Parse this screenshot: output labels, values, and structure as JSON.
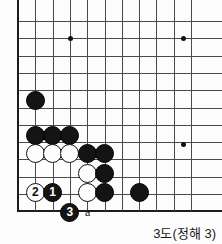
{
  "diagram": {
    "caption": "3도(정해 3)",
    "board": {
      "origin_x": 18,
      "origin_y": 21,
      "spacing": 17.3,
      "cols": 11,
      "rows": 12,
      "left_edge": true,
      "bottom_edge": true,
      "line_color": "#4a4a4a",
      "edge_color": "#1c1c1c"
    },
    "star_points": [
      {
        "name": "star-point-top-left",
        "col": 3,
        "row": 1
      },
      {
        "name": "star-point-top-right",
        "col": 9.55,
        "row": 1
      },
      {
        "name": "star-point-right",
        "col": 9.55,
        "row": 7.1
      }
    ],
    "stones": [
      {
        "name": "black-stone-left-upper",
        "color": "black",
        "col": 1,
        "row": 4.6,
        "label": ""
      },
      {
        "name": "black-stone-wall-a",
        "color": "black",
        "col": 1,
        "row": 6.6,
        "label": ""
      },
      {
        "name": "black-stone-wall-b",
        "color": "black",
        "col": 2,
        "row": 6.6,
        "label": ""
      },
      {
        "name": "black-stone-wall-c",
        "color": "black",
        "col": 3,
        "row": 6.6,
        "label": ""
      },
      {
        "name": "white-stone-row-a",
        "color": "white",
        "col": 1,
        "row": 7.65,
        "label": ""
      },
      {
        "name": "white-stone-row-b",
        "color": "white",
        "col": 2,
        "row": 7.65,
        "label": ""
      },
      {
        "name": "white-stone-row-c",
        "color": "white",
        "col": 3,
        "row": 7.65,
        "label": ""
      },
      {
        "name": "black-stone-corner-d",
        "color": "black",
        "col": 4,
        "row": 7.65,
        "label": ""
      },
      {
        "name": "black-stone-corner-e",
        "color": "black",
        "col": 5,
        "row": 7.65,
        "label": ""
      },
      {
        "name": "white-stone-inner-a",
        "color": "white",
        "col": 4,
        "row": 8.8,
        "label": ""
      },
      {
        "name": "black-stone-side-a",
        "color": "black",
        "col": 5,
        "row": 8.8,
        "label": ""
      },
      {
        "name": "white-stone-inner-b",
        "color": "white",
        "col": 4,
        "row": 9.9,
        "label": ""
      },
      {
        "name": "black-stone-side-b",
        "color": "black",
        "col": 5,
        "row": 9.9,
        "label": ""
      },
      {
        "name": "white-stone-move-2",
        "color": "white",
        "col": 1,
        "row": 9.9,
        "label": "2"
      },
      {
        "name": "black-stone-move-1",
        "color": "black",
        "col": 2,
        "row": 9.9,
        "label": "1"
      },
      {
        "name": "black-stone-move-3",
        "color": "black",
        "col": 3,
        "row": 11.05,
        "label": "3"
      },
      {
        "name": "black-stone-right-lower",
        "color": "black",
        "col": 7,
        "row": 9.9,
        "label": ""
      }
    ],
    "point_labels": [
      {
        "name": "point-label-a",
        "text": "a",
        "col": 4.05,
        "row": 11.05
      }
    ]
  }
}
